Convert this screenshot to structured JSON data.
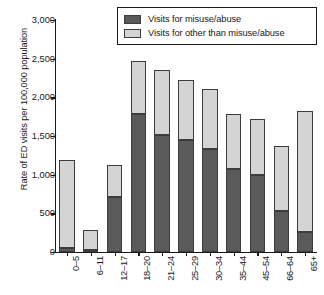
{
  "chart_data": {
    "type": "bar",
    "subtype": "stacked-bar",
    "title": "",
    "xlabel": "",
    "ylabel": "Rate of ED visits per 100,000 population",
    "ylim": [
      0,
      3000
    ],
    "ytick_values": [
      0,
      500,
      1000,
      1500,
      2000,
      2500,
      3000
    ],
    "ytick_labels": [
      "0",
      "500",
      "1,000",
      "1,500",
      "2,000",
      "2,500",
      "3,000"
    ],
    "grid": false,
    "legend_position": "top-right",
    "categories": [
      "0–5",
      "6–11",
      "12–17",
      "18–20",
      "21–24",
      "25–29",
      "30–34",
      "35–44",
      "45–54",
      "66–64",
      "65+"
    ],
    "series": [
      {
        "name": "Visits for misuse/abuse",
        "color": "#5a5a5a",
        "values": [
          50,
          25,
          715,
          1780,
          1510,
          1450,
          1330,
          1070,
          1000,
          535,
          265
        ]
      },
      {
        "name": "Visits for other than misuse/abuse",
        "color": "#d4d4d4",
        "values": [
          1140,
          260,
          405,
          690,
          840,
          780,
          780,
          715,
          725,
          840,
          1560
        ]
      }
    ],
    "totals": [
      1190,
      285,
      1120,
      2470,
      2350,
      2230,
      2110,
      1785,
      1725,
      1375,
      1825
    ]
  },
  "legend": {
    "items": [
      {
        "label": "Visits for misuse/abuse",
        "color": "#5a5a5a"
      },
      {
        "label": "Visits for other than misuse/abuse",
        "color": "#d4d4d4"
      }
    ]
  },
  "colors": {
    "misuse": "#5a5a5a",
    "other": "#d4d4d4",
    "axis": "#1a1a1a",
    "bar_outline": "#3d3d3d",
    "background": "#ffffff"
  }
}
